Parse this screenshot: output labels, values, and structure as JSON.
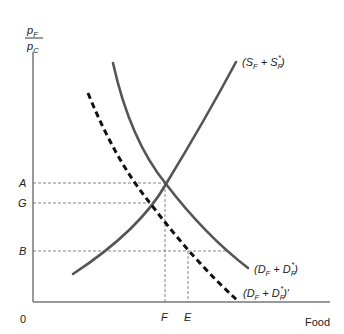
{
  "diagram": {
    "type": "supply-demand",
    "y_axis_label": {
      "numerator": "p",
      "numerator_sub": "F",
      "denominator": "p",
      "denominator_sub": "C"
    },
    "x_axis_label": "Food",
    "origin_label": "0",
    "price_levels": [
      {
        "label": "A",
        "y": 183,
        "x_end": 166
      },
      {
        "label": "G",
        "y": 203,
        "x_end": 150
      },
      {
        "label": "B",
        "y": 251,
        "x_end": 228
      }
    ],
    "quantity_levels": [
      {
        "label": "F",
        "x": 165,
        "y_start": 184
      },
      {
        "label": "E",
        "x": 188,
        "y_start": 251
      }
    ],
    "curves": [
      {
        "name": "supply",
        "label_open": "(S",
        "label_sub1": "F",
        "label_mid": " + S",
        "label_sub2": "F",
        "label_sup": "*",
        "label_close": ")",
        "style": "solid"
      },
      {
        "name": "demand",
        "label_open": "(D",
        "label_sub1": "F",
        "label_mid": " + D",
        "label_sub2": "F",
        "label_sup": "*",
        "label_close": ")",
        "style": "solid"
      },
      {
        "name": "demand-shifted",
        "label_open": "(D",
        "label_sub1": "F",
        "label_mid": " + D",
        "label_sub2": "F",
        "label_sup": "*",
        "label_close": ")′",
        "style": "dashed"
      }
    ],
    "colors": {
      "curve": "#555555",
      "dashed_curve": "#111111",
      "axis": "#777777",
      "guide": "#666666",
      "text": "#222222"
    }
  }
}
